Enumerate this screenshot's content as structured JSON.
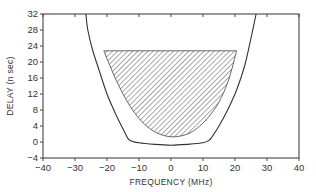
{
  "chart_data": {
    "type": "line",
    "title": "",
    "xlabel": "FREQUENCY (MHz)",
    "ylabel": "DELAY (n sec)",
    "xlim": [
      -40,
      40
    ],
    "ylim": [
      -4,
      32
    ],
    "xticks": [
      -40,
      -30,
      -20,
      -10,
      0,
      10,
      20,
      30,
      40
    ],
    "yticks": [
      -4,
      0,
      4,
      8,
      12,
      16,
      20,
      24,
      28,
      32
    ],
    "grid": false,
    "legend": null,
    "series": [
      {
        "name": "outer-boundary",
        "style": "solid-line",
        "x": [
          -26.6,
          -26,
          -24.5,
          -22.5,
          -20,
          -17,
          -14.5,
          -13,
          -10,
          -5,
          0,
          5,
          10,
          12,
          13,
          15,
          18,
          20.5,
          23,
          25,
          26.6
        ],
        "y": [
          32,
          28,
          23,
          18,
          12,
          6.5,
          2.5,
          0.5,
          -0.2,
          -0.6,
          -0.8,
          -0.6,
          -0.2,
          0.5,
          1.5,
          4,
          8.5,
          13,
          19,
          26,
          32
        ]
      },
      {
        "name": "hatched-region",
        "style": "hatched-fill",
        "x": [
          -21,
          -18,
          -15,
          -12,
          -9,
          -6,
          -3,
          0,
          3,
          6,
          9,
          12,
          15,
          18,
          20.5,
          20.5,
          -21
        ],
        "y": [
          22.8,
          17,
          12,
          8,
          5,
          3,
          1.8,
          1.3,
          1.5,
          2.3,
          4,
          6.5,
          10,
          15.5,
          22.8,
          22.8,
          22.8
        ]
      }
    ]
  }
}
